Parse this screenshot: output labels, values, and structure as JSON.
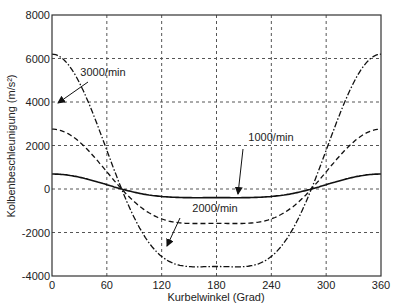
{
  "chart_data": {
    "type": "line",
    "title": "",
    "xlabel": "Kurbelwinkel (Grad)",
    "ylabel": "Kolbenbeschleunigung (m/s²)",
    "xlim": [
      0,
      360
    ],
    "ylim": [
      -4000,
      8000
    ],
    "xticks": [
      0,
      60,
      120,
      180,
      240,
      300,
      360
    ],
    "yticks": [
      -4000,
      -2000,
      0,
      2000,
      4000,
      6000,
      8000
    ],
    "grid": true,
    "legend": "annotations with arrows",
    "model": "a = A*(cos(phi) + lambda*cos(2*phi)), lambda≈0.27",
    "series": [
      {
        "name": "1000/min",
        "style": "solid",
        "peak_at_0": 690,
        "min_at_180": -430,
        "annotation": {
          "text": "1000/min",
          "arrow_to_x": 194
        }
      },
      {
        "name": "2000/min",
        "style": "dashed",
        "peak_at_0": 2750,
        "min_at_180": -1700,
        "annotation": {
          "text": "2000/min",
          "arrow_to_x": 124
        }
      },
      {
        "name": "3000/min",
        "style": "dash-dot",
        "peak_at_0": 6200,
        "min_at_180": -3820,
        "annotation": {
          "text": "3000/min",
          "arrow_to_x": 40
        }
      }
    ],
    "zero_crossings_deg": [
      77,
      283
    ]
  }
}
